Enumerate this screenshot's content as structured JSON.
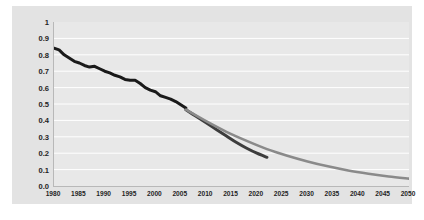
{
  "chart_data": {
    "type": "line",
    "title": "",
    "xlabel": "",
    "ylabel": "Metric tons carbon dioxide per $1,000 GDP",
    "xlim": [
      1980,
      2050
    ],
    "ylim": [
      0.0,
      1.0
    ],
    "grid": true,
    "legend": "none",
    "xticks": [
      "1980",
      "1985",
      "1990",
      "1995",
      "2000",
      "2005",
      "2010",
      "2015",
      "2020",
      "2025",
      "2030",
      "2035",
      "2040",
      "2045",
      "2050"
    ],
    "yticks": [
      "1",
      "0.9",
      "0.8",
      "0.7",
      "0.6",
      "0.5",
      "0.4",
      "0.3",
      "0.2",
      "0.1",
      "0.0"
    ],
    "series": [
      {
        "name": "history",
        "color": "#1a1a1a",
        "x": [
          1980,
          1981,
          1982,
          1983,
          1984,
          1985,
          1986,
          1987,
          1988,
          1989,
          1990,
          1991,
          1992,
          1993,
          1994,
          1995,
          1996,
          1997,
          1998,
          1999,
          2000,
          2001,
          2002,
          2003,
          2004,
          2005,
          2006
        ],
        "values": [
          0.84,
          0.83,
          0.8,
          0.78,
          0.76,
          0.75,
          0.735,
          0.725,
          0.73,
          0.715,
          0.7,
          0.69,
          0.675,
          0.665,
          0.65,
          0.645,
          0.645,
          0.625,
          0.6,
          0.585,
          0.575,
          0.55,
          0.54,
          0.53,
          0.515,
          0.495,
          0.475
        ]
      },
      {
        "name": "recent-steep-decline",
        "color": "#3d3d3d",
        "x": [
          2006,
          2008,
          2010,
          2012,
          2014,
          2016,
          2018,
          2020,
          2022
        ],
        "values": [
          0.465,
          0.425,
          0.385,
          0.345,
          0.305,
          0.265,
          0.23,
          0.2,
          0.175
        ]
      },
      {
        "name": "projection",
        "color": "#8a8a8a",
        "x": [
          2006,
          2010,
          2014,
          2018,
          2022,
          2026,
          2030,
          2034,
          2038,
          2042,
          2046,
          2050
        ],
        "values": [
          0.465,
          0.395,
          0.33,
          0.275,
          0.225,
          0.185,
          0.15,
          0.12,
          0.095,
          0.075,
          0.058,
          0.045
        ]
      }
    ]
  },
  "colors": {
    "card_background": "#e3e3e3",
    "plot_background": "#e8e8e8",
    "gridline": "#ffffff",
    "axis": "#b8b8b8",
    "history_line": "#1a1a1a",
    "recent_line": "#3d3d3d",
    "projection_line": "#8a8a8a",
    "tick_text": "#1f1f1f"
  }
}
